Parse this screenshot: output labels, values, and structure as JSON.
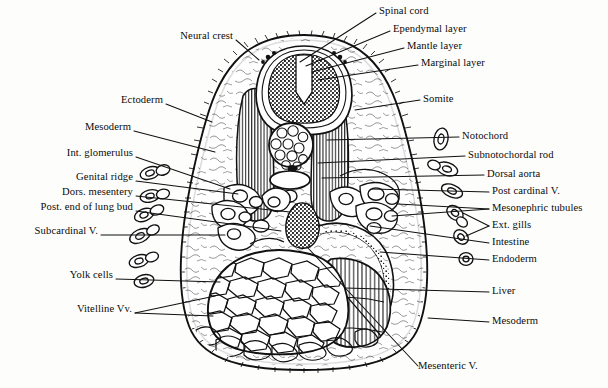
{
  "figure": {
    "kind": "anatomical-cross-section",
    "ink_color": "#111111",
    "paper_color": "#fdfdfc"
  },
  "labels_left": [
    {
      "id": "neural-crest",
      "text": "Neural crest",
      "x": 163,
      "y": 36,
      "w": 70,
      "tip_x": 259,
      "tip_y": 60
    },
    {
      "id": "ectoderm",
      "text": "Ectoderm",
      "x": 93,
      "y": 100,
      "w": 70,
      "tip_x": 212,
      "tip_y": 122
    },
    {
      "id": "mesoderm-left",
      "text": "Mesoderm",
      "x": 59,
      "y": 127,
      "w": 72,
      "tip_x": 215,
      "tip_y": 152
    },
    {
      "id": "int-glomerulus",
      "text": "Int. glomerulus",
      "x": 50,
      "y": 153,
      "w": 83,
      "tip_x": 230,
      "tip_y": 189
    },
    {
      "id": "genital-ridge",
      "text": "Genital ridge",
      "x": 62,
      "y": 177,
      "w": 71,
      "tip_x": 238,
      "tip_y": 194
    },
    {
      "id": "dors-mesentery",
      "text": "Dors. mesentery",
      "x": 44,
      "y": 192,
      "w": 89,
      "tip_x": 290,
      "tip_y": 212
    },
    {
      "id": "post-end-lung-bud",
      "text": "Post. end of lung bud",
      "x": 9,
      "y": 207,
      "w": 124,
      "tip_x": 281,
      "tip_y": 231
    },
    {
      "id": "subcardinal-v",
      "text": "Subcardinal V.",
      "x": 16,
      "y": 231,
      "w": 82,
      "tip_x": 225,
      "tip_y": 235
    },
    {
      "id": "yolk-cells",
      "text": "Yolk cells",
      "x": 52,
      "y": 275,
      "w": 61,
      "tip_x": 220,
      "tip_y": 282
    },
    {
      "id": "vitelline-vv",
      "text": "Vitelline Vv.",
      "x": 59,
      "y": 309,
      "w": 73,
      "tip_x": 210,
      "tip_y": 300
    }
  ],
  "labels_right": [
    {
      "id": "spinal-cord",
      "text": "Spinal cord",
      "x": 379,
      "y": 6,
      "tip_x": 300,
      "tip_y": 60
    },
    {
      "id": "ependymal-layer",
      "text": "Ependymal layer",
      "x": 393,
      "y": 24,
      "tip_x": 306,
      "tip_y": 64
    },
    {
      "id": "mantle-layer",
      "text": "Mantle layer",
      "x": 407,
      "y": 41,
      "tip_x": 312,
      "tip_y": 68
    },
    {
      "id": "marginal-layer",
      "text": "Marginal layer",
      "x": 421,
      "y": 58,
      "tip_x": 318,
      "tip_y": 74
    },
    {
      "id": "somite",
      "text": "Somite",
      "x": 423,
      "y": 96,
      "tip_x": 355,
      "tip_y": 110
    },
    {
      "id": "notochord",
      "text": "Notochord",
      "x": 462,
      "y": 133,
      "tip_x": 327,
      "tip_y": 140
    },
    {
      "id": "subnotochordal-rod",
      "text": "Subnotochordal rod",
      "x": 468,
      "y": 152,
      "tip_x": 318,
      "tip_y": 163
    },
    {
      "id": "dorsal-aorta",
      "text": "Dorsal aorta",
      "x": 487,
      "y": 171,
      "tip_x": 322,
      "tip_y": 178
    },
    {
      "id": "post-cardinal-v",
      "text": "Post cardinal V.",
      "x": 492,
      "y": 188,
      "tip_x": 372,
      "tip_y": 189
    },
    {
      "id": "mesonephric-tubules",
      "text": "Mesonephric tubules",
      "x": 492,
      "y": 205,
      "tip_x": 398,
      "tip_y": 204
    },
    {
      "id": "ext-gills",
      "text": "Ext. gills",
      "x": 492,
      "y": 222,
      "tip_x": 460,
      "tip_y": 212
    },
    {
      "id": "intestine",
      "text": "Intestine",
      "x": 492,
      "y": 239,
      "tip_x": 370,
      "tip_y": 226
    },
    {
      "id": "endoderm",
      "text": "Endoderm",
      "x": 492,
      "y": 256,
      "tip_x": 380,
      "tip_y": 252
    },
    {
      "id": "liver",
      "text": "Liver",
      "x": 492,
      "y": 288,
      "tip_x": 345,
      "tip_y": 288
    },
    {
      "id": "mesoderm-right",
      "text": "Mesoderm",
      "x": 492,
      "y": 318,
      "tip_x": 428,
      "tip_y": 318
    }
  ],
  "labels_bottom": [
    {
      "id": "mesenteric-v",
      "text": "Mesenteric V.",
      "x": 418,
      "y": 366,
      "tip_x": 308,
      "tip_y": 248
    }
  ],
  "structures": [
    {
      "id": "body-outline",
      "name": "embryo body outline"
    },
    {
      "id": "neural-tube",
      "name": "neural tube / spinal cord"
    },
    {
      "id": "notochord-body",
      "name": "notochord"
    },
    {
      "id": "subnotochordal-rod",
      "name": "subnotochordal rod"
    },
    {
      "id": "somite-left",
      "name": "left somite"
    },
    {
      "id": "somite-right",
      "name": "right somite"
    },
    {
      "id": "yolk-mass",
      "name": "yolk cell mass"
    },
    {
      "id": "liver-mass",
      "name": "liver"
    },
    {
      "id": "gut-intestine",
      "name": "intestine / gut"
    },
    {
      "id": "ext-gill-left",
      "name": "external gills (left)"
    },
    {
      "id": "ext-gill-right",
      "name": "external gills (right)"
    },
    {
      "id": "ectoderm-edge",
      "name": "ectoderm ladder border"
    }
  ]
}
